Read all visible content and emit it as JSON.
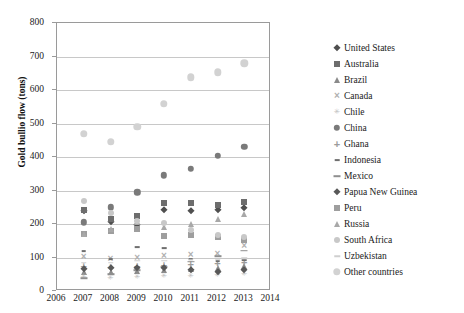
{
  "chart_data": {
    "type": "scatter",
    "title": "",
    "xlabel": "",
    "ylabel": "Gold bullio flow (tons)",
    "xlim": [
      2006,
      2014
    ],
    "ylim": [
      0,
      800
    ],
    "grid": true,
    "legend_position": "right",
    "x_ticks": [
      "2006",
      "2007",
      "2008",
      "2009",
      "2010",
      "2011",
      "2012",
      "2013",
      "2014"
    ],
    "y_ticks": [
      "0",
      "100",
      "200",
      "300",
      "400",
      "500",
      "600",
      "700",
      "800"
    ],
    "x": [
      2007,
      2008,
      2009,
      2010,
      2011,
      2012,
      2013
    ],
    "series": [
      {
        "name": "United States",
        "marker": "diamond",
        "color": "#4f4f4f",
        "values": [
          238,
          205,
          196,
          243,
          240,
          243,
          247
        ]
      },
      {
        "name": "Australia",
        "marker": "square",
        "color": "#6d6d6d",
        "values": [
          243,
          215,
          224,
          263,
          262,
          258,
          265
        ]
      },
      {
        "name": "Brazil",
        "marker": "triangle",
        "color": "#8a8a8a",
        "values": [
          58,
          56,
          60,
          64,
          67,
          70,
          75
        ]
      },
      {
        "name": "Canada",
        "marker": "x",
        "color": "#b0b0b0",
        "values": [
          101,
          96,
          98,
          104,
          107,
          110,
          133
        ]
      },
      {
        "name": "Chile",
        "marker": "star",
        "color": "#c2c2c2",
        "values": [
          42,
          40,
          41,
          45,
          46,
          49,
          52
        ]
      },
      {
        "name": "China",
        "marker": "circle",
        "color": "#7a7a7a",
        "values": [
          205,
          250,
          295,
          345,
          365,
          403,
          430
        ]
      },
      {
        "name": "Ghana",
        "marker": "plus",
        "color": "#9b9b9b",
        "values": [
          75,
          72,
          74,
          79,
          82,
          85,
          88
        ]
      },
      {
        "name": "Indonesia",
        "marker": "dash-small",
        "color": "#6f6f6f",
        "values": [
          118,
          96,
          130,
          128,
          96,
          89,
          93
        ]
      },
      {
        "name": "Mexico",
        "marker": "dash",
        "color": "#8f8f8f",
        "values": [
          39,
          50,
          62,
          72,
          88,
          103,
          120
        ]
      },
      {
        "name": "Papua New Guinea",
        "marker": "diamond",
        "color": "#585858",
        "values": [
          65,
          69,
          70,
          68,
          64,
          57,
          62
        ]
      },
      {
        "name": "Peru",
        "marker": "square",
        "color": "#9e9e9e",
        "values": [
          170,
          180,
          184,
          164,
          166,
          161,
          151
        ]
      },
      {
        "name": "Russia",
        "marker": "triangle",
        "color": "#a8a8a8",
        "values": [
          169,
          184,
          205,
          192,
          200,
          215,
          230
        ]
      },
      {
        "name": "South Africa",
        "marker": "dot-light",
        "color": "#c8c8c8",
        "values": [
          270,
          234,
          210,
          203,
          181,
          167,
          160
        ]
      },
      {
        "name": "Uzbekistan",
        "marker": "dash-light",
        "color": "#cfcfcf",
        "values": [
          85,
          85,
          90,
          90,
          93,
          93,
          98
        ]
      },
      {
        "name": "Other countries",
        "marker": "circle-light",
        "color": "#d2d2d2",
        "values": [
          470,
          445,
          490,
          558,
          638,
          653,
          680
        ]
      }
    ]
  },
  "legend": {
    "items": [
      {
        "label": "United States",
        "marker": "diamond",
        "color": "#4f4f4f"
      },
      {
        "label": "Australia",
        "marker": "square",
        "color": "#6d6d6d"
      },
      {
        "label": "Brazil",
        "marker": "triangle",
        "color": "#8a8a8a"
      },
      {
        "label": "Canada",
        "marker": "x",
        "color": "#b0b0b0"
      },
      {
        "label": "Chile",
        "marker": "star",
        "color": "#c2c2c2"
      },
      {
        "label": "China",
        "marker": "circle",
        "color": "#7a7a7a"
      },
      {
        "label": "Ghana",
        "marker": "plus",
        "color": "#9b9b9b"
      },
      {
        "label": "Indonesia",
        "marker": "dash-small",
        "color": "#6f6f6f"
      },
      {
        "label": "Mexico",
        "marker": "dash",
        "color": "#8f8f8f"
      },
      {
        "label": "Papua New Guinea",
        "marker": "diamond",
        "color": "#585858"
      },
      {
        "label": "Peru",
        "marker": "square",
        "color": "#9e9e9e"
      },
      {
        "label": "Russia",
        "marker": "triangle",
        "color": "#a8a8a8"
      },
      {
        "label": "South Africa",
        "marker": "dot-light",
        "color": "#c8c8c8"
      },
      {
        "label": "Uzbekistan",
        "marker": "dash-light",
        "color": "#cfcfcf"
      },
      {
        "label": "Other countries",
        "marker": "circle-light",
        "color": "#d2d2d2"
      }
    ]
  }
}
